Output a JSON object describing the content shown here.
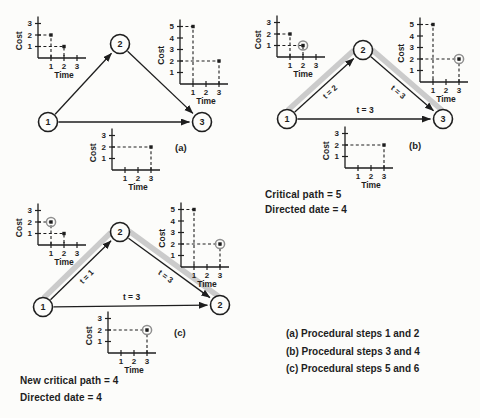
{
  "page": {
    "background": "#fcfcfa",
    "ink": "#1e1e1e",
    "highlight_color": "#cbcbcb",
    "marker_ring_color": "#8f8f8f"
  },
  "chart_defaults": {
    "xlabel": "Time",
    "ylabel": "Cost",
    "x_unit_px": 13,
    "y_unit_px": 11.5
  },
  "sections": [
    {
      "id": "a",
      "tag": "(a)",
      "network": {
        "node_radius": 9.5,
        "nodes": [
          {
            "label": "1",
            "x": 48,
            "y": 122
          },
          {
            "label": "2",
            "x": 120,
            "y": 44
          },
          {
            "label": "3",
            "x": 202,
            "y": 122
          }
        ],
        "edges": [
          {
            "from": 0,
            "to": 1,
            "label": "",
            "rotate_label": true,
            "highlight": false
          },
          {
            "from": 1,
            "to": 2,
            "label": "",
            "rotate_label": true,
            "highlight": false
          },
          {
            "from": 0,
            "to": 2,
            "label": "",
            "rotate_label": false,
            "highlight": false
          }
        ]
      },
      "charts": [
        {
          "name": "chart-a-activity-1-2",
          "origin": {
            "x": 38,
            "y": 58
          },
          "y_ticks": [
            1,
            2,
            3
          ],
          "x_ticks": [
            1,
            2,
            3
          ],
          "points": [
            {
              "t": 1,
              "c": 2,
              "circled": false
            },
            {
              "t": 2,
              "c": 1,
              "circled": false
            }
          ]
        },
        {
          "name": "chart-a-activity-2-3",
          "origin": {
            "x": 180,
            "y": 84
          },
          "y_ticks": [
            1,
            2,
            3,
            4,
            5
          ],
          "x_ticks": [
            1,
            2,
            3
          ],
          "points": [
            {
              "t": 1,
              "c": 5,
              "circled": false
            },
            {
              "t": 3,
              "c": 2,
              "circled": false
            }
          ]
        },
        {
          "name": "chart-a-activity-1-3",
          "origin": {
            "x": 112,
            "y": 170
          },
          "y_ticks": [
            1,
            2,
            3
          ],
          "x_ticks": [
            1,
            2,
            3
          ],
          "points": [
            {
              "t": 3,
              "c": 2,
              "circled": false
            }
          ]
        }
      ],
      "notes": []
    },
    {
      "id": "b",
      "tag": "(b)",
      "network": {
        "node_radius": 9.5,
        "nodes": [
          {
            "label": "1",
            "x": 287,
            "y": 119
          },
          {
            "label": "2",
            "x": 363,
            "y": 50
          },
          {
            "label": "3",
            "x": 443,
            "y": 119
          }
        ],
        "edges": [
          {
            "from": 0,
            "to": 1,
            "label": "t = 2",
            "rotate_label": true,
            "highlight": true
          },
          {
            "from": 1,
            "to": 2,
            "label": "t = 3",
            "rotate_label": true,
            "highlight": true
          },
          {
            "from": 0,
            "to": 2,
            "label": "t = 3",
            "rotate_label": false,
            "highlight": false
          }
        ]
      },
      "charts": [
        {
          "name": "chart-b-activity-1-2",
          "origin": {
            "x": 277,
            "y": 57
          },
          "y_ticks": [
            1,
            2,
            3
          ],
          "x_ticks": [
            1,
            2,
            3
          ],
          "points": [
            {
              "t": 1,
              "c": 2,
              "circled": false
            },
            {
              "t": 2,
              "c": 1,
              "circled": true
            }
          ]
        },
        {
          "name": "chart-b-activity-2-3",
          "origin": {
            "x": 420,
            "y": 82
          },
          "y_ticks": [
            1,
            2,
            3,
            4,
            5
          ],
          "x_ticks": [
            1,
            2,
            3
          ],
          "points": [
            {
              "t": 1,
              "c": 5,
              "circled": false
            },
            {
              "t": 3,
              "c": 2,
              "circled": true
            }
          ]
        },
        {
          "name": "chart-b-activity-1-3",
          "origin": {
            "x": 345,
            "y": 168
          },
          "y_ticks": [
            1,
            2,
            3
          ],
          "x_ticks": [
            1,
            2,
            3
          ],
          "points": [
            {
              "t": 3,
              "c": 2,
              "circled": false
            }
          ]
        }
      ],
      "notes": [
        {
          "text": "Critical path = 5"
        },
        {
          "text": "Directed date = 4"
        }
      ]
    },
    {
      "id": "c",
      "tag": "(c)",
      "network": {
        "node_radius": 9.5,
        "nodes": [
          {
            "label": "1",
            "x": 43,
            "y": 307
          },
          {
            "label": "2",
            "x": 120,
            "y": 232
          },
          {
            "label": "2",
            "x": 220,
            "y": 305
          }
        ],
        "edges": [
          {
            "from": 0,
            "to": 1,
            "label": "t = 1",
            "rotate_label": true,
            "highlight": true
          },
          {
            "from": 1,
            "to": 2,
            "label": "t = 3",
            "rotate_label": true,
            "highlight": true
          },
          {
            "from": 0,
            "to": 2,
            "label": "t = 3",
            "rotate_label": false,
            "highlight": false
          }
        ]
      },
      "charts": [
        {
          "name": "chart-c-activity-1-2",
          "origin": {
            "x": 38,
            "y": 245
          },
          "y_ticks": [
            1,
            2,
            3
          ],
          "x_ticks": [
            1,
            2,
            3
          ],
          "points": [
            {
              "t": 1,
              "c": 2,
              "circled": true
            },
            {
              "t": 2,
              "c": 1,
              "circled": false
            }
          ]
        },
        {
          "name": "chart-c-activity-2-3",
          "origin": {
            "x": 181,
            "y": 267
          },
          "y_ticks": [
            1,
            2,
            3,
            4,
            5
          ],
          "x_ticks": [
            1,
            2,
            3
          ],
          "points": [
            {
              "t": 1,
              "c": 5,
              "circled": false
            },
            {
              "t": 3,
              "c": 2,
              "circled": true
            }
          ]
        },
        {
          "name": "chart-c-activity-1-3",
          "origin": {
            "x": 108,
            "y": 353
          },
          "y_ticks": [
            1,
            2,
            3
          ],
          "x_ticks": [
            1,
            2,
            3
          ],
          "points": [
            {
              "t": 3,
              "c": 2,
              "circled": true
            }
          ]
        }
      ],
      "notes": [
        {
          "text": "New critical path = 4"
        },
        {
          "text": "Directed date = 4"
        }
      ]
    }
  ],
  "captions": [
    {
      "text": "(a) Procedural steps 1 and 2"
    },
    {
      "text": "(b) Procedural steps 3 and 4"
    },
    {
      "text": "(c) Procedural steps 5 and 6"
    }
  ],
  "chart_data": [
    {
      "type": "scatter",
      "panel": "(a)",
      "series": "activity 1-2",
      "xlabel": "Time",
      "ylabel": "Cost",
      "x": [
        1,
        2
      ],
      "y": [
        2,
        1
      ],
      "xlim": [
        0,
        3.7
      ],
      "ylim": [
        0,
        3.6
      ],
      "circled_point": null
    },
    {
      "type": "scatter",
      "panel": "(a)",
      "series": "activity 2-3",
      "xlabel": "Time",
      "ylabel": "Cost",
      "x": [
        1,
        3
      ],
      "y": [
        5,
        2
      ],
      "xlim": [
        0,
        3.7
      ],
      "ylim": [
        0,
        5.6
      ],
      "circled_point": null
    },
    {
      "type": "scatter",
      "panel": "(a)",
      "series": "activity 1-3",
      "xlabel": "Time",
      "ylabel": "Cost",
      "x": [
        3
      ],
      "y": [
        2
      ],
      "xlim": [
        0,
        3.7
      ],
      "ylim": [
        0,
        3.6
      ],
      "circled_point": null
    },
    {
      "type": "scatter",
      "panel": "(b)",
      "series": "activity 1-2",
      "xlabel": "Time",
      "ylabel": "Cost",
      "x": [
        1,
        2
      ],
      "y": [
        2,
        1
      ],
      "xlim": [
        0,
        3.7
      ],
      "ylim": [
        0,
        3.6
      ],
      "circled_point": [
        2,
        1
      ]
    },
    {
      "type": "scatter",
      "panel": "(b)",
      "series": "activity 2-3",
      "xlabel": "Time",
      "ylabel": "Cost",
      "x": [
        1,
        3
      ],
      "y": [
        5,
        2
      ],
      "xlim": [
        0,
        3.7
      ],
      "ylim": [
        0,
        5.6
      ],
      "circled_point": [
        3,
        2
      ]
    },
    {
      "type": "scatter",
      "panel": "(b)",
      "series": "activity 1-3",
      "xlabel": "Time",
      "ylabel": "Cost",
      "x": [
        3
      ],
      "y": [
        2
      ],
      "xlim": [
        0,
        3.7
      ],
      "ylim": [
        0,
        3.6
      ],
      "circled_point": null
    },
    {
      "type": "scatter",
      "panel": "(c)",
      "series": "activity 1-2",
      "xlabel": "Time",
      "ylabel": "Cost",
      "x": [
        1,
        2
      ],
      "y": [
        2,
        1
      ],
      "xlim": [
        0,
        3.7
      ],
      "ylim": [
        0,
        3.6
      ],
      "circled_point": [
        1,
        2
      ]
    },
    {
      "type": "scatter",
      "panel": "(c)",
      "series": "activity 2-3",
      "xlabel": "Time",
      "ylabel": "Cost",
      "x": [
        1,
        3
      ],
      "y": [
        5,
        2
      ],
      "xlim": [
        0,
        3.7
      ],
      "ylim": [
        0,
        5.6
      ],
      "circled_point": [
        3,
        2
      ]
    },
    {
      "type": "scatter",
      "panel": "(c)",
      "series": "activity 1-3",
      "xlabel": "Time",
      "ylabel": "Cost",
      "x": [
        3
      ],
      "y": [
        2
      ],
      "xlim": [
        0,
        3.7
      ],
      "ylim": [
        0,
        3.6
      ],
      "circled_point": [
        3,
        2
      ]
    }
  ]
}
